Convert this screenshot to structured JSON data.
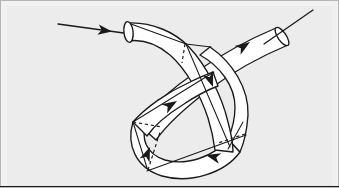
{
  "figure": {
    "title": "Knotted tube with directed axis",
    "domain_kind": "diagram",
    "width": 339,
    "height": 188,
    "background_color": "#ececec",
    "border_color": "#b6b6b6",
    "tube_fill_color": "#ffffff",
    "stroke_color": "#1a1a1a",
    "hidden_edge_style": "dashed"
  },
  "elements": {
    "background_panel": "background-panel",
    "outer_border": "outer-border",
    "tube_body": "knotted-tube-body",
    "left_mouth": "tube-mouth-left",
    "right_mouth": "tube-mouth-right",
    "axis_line_in": "axis-line-entering",
    "axis_line_out": "axis-line-exiting",
    "hidden_edges": "hidden-edge-dashes",
    "ruling_lines": "surface-ruling-lines"
  },
  "arrows": [
    {
      "id": "arrow-entering-axis",
      "label": "entering axis arrow",
      "x": 106,
      "y": 30,
      "angle": 14
    },
    {
      "id": "arrow-upper-right-exit",
      "label": "upper right exit arrow",
      "x": 243,
      "y": 42,
      "angle": -36
    },
    {
      "id": "arrow-descending-crossing",
      "label": "descending crossing arrow",
      "x": 211,
      "y": 80,
      "angle": 58
    },
    {
      "id": "arrow-lower-left-ascending",
      "label": "lower left ascending arrow",
      "x": 166,
      "y": 104,
      "angle": -38
    },
    {
      "id": "arrow-bottom-left-upward",
      "label": "bottom left upward arrow",
      "x": 152,
      "y": 155,
      "angle": -64
    },
    {
      "id": "arrow-bottom-right-leftward",
      "label": "bottom right leftward arrow",
      "x": 214,
      "y": 153,
      "angle": 192
    }
  ],
  "chart_data": {
    "type": "diagram",
    "title": "Knotted tube with directed axis",
    "notes": [
      "Single overhand knot formed in a tube of constant circular cross-section.",
      "Open circular mouth at upper-left end of tube.",
      "Open circular mouth at upper-right end of tube.",
      "One straight axis line enters from the far left.",
      "One straight axis line exits toward the upper right.",
      "Six solid triangular arrowheads indicate orientation along the curve.",
      "Dashed line segments denote contour edges occluded by the tube."
    ],
    "crossings": 3,
    "arrow_count": 6,
    "open_ends": 2,
    "hidden_edge_count": 4
  }
}
